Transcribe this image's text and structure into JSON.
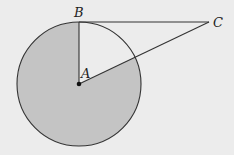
{
  "diagram": {
    "type": "geometry",
    "points": {
      "A": {
        "label": "A",
        "x": 79,
        "y": 84
      },
      "B": {
        "label": "B",
        "x": 79,
        "y": 22
      },
      "C": {
        "label": "C",
        "x": 209,
        "y": 22
      }
    },
    "circle": {
      "center": "A",
      "radius": 62
    },
    "segments": [
      [
        "A",
        "B"
      ],
      [
        "B",
        "C"
      ],
      [
        "A",
        "C"
      ]
    ],
    "shaded_region": "major sector of circle outside angle BAC",
    "colors": {
      "background": "#ececec",
      "shade": "#c4c4c4",
      "stroke": "#333333"
    }
  }
}
